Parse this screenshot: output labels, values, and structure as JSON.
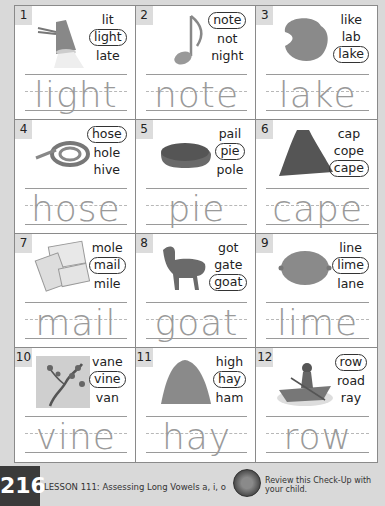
{
  "items": [
    {
      "num": "1",
      "image": "lamp-image",
      "choices": [
        "lit",
        "light",
        "late"
      ],
      "selected": 1,
      "answer": "light"
    },
    {
      "num": "2",
      "image": "music-note-image",
      "choices": [
        "note",
        "not",
        "night"
      ],
      "selected": 0,
      "answer": "note"
    },
    {
      "num": "3",
      "image": "lake-image",
      "choices": [
        "like",
        "lab",
        "lake"
      ],
      "selected": 2,
      "answer": "lake"
    },
    {
      "num": "4",
      "image": "hose-image",
      "choices": [
        "hose",
        "hole",
        "hive"
      ],
      "selected": 0,
      "answer": "hose"
    },
    {
      "num": "5",
      "image": "pie-image",
      "choices": [
        "pail",
        "pie",
        "pole"
      ],
      "selected": 1,
      "answer": "pie"
    },
    {
      "num": "6",
      "image": "cape-image",
      "choices": [
        "cap",
        "cope",
        "cape"
      ],
      "selected": 2,
      "answer": "cape"
    },
    {
      "num": "7",
      "image": "mail-image",
      "choices": [
        "mole",
        "mail",
        "mile"
      ],
      "selected": 1,
      "answer": "mail"
    },
    {
      "num": "8",
      "image": "goat-image",
      "choices": [
        "got",
        "gate",
        "goat"
      ],
      "selected": 2,
      "answer": "goat"
    },
    {
      "num": "9",
      "image": "lime-image",
      "choices": [
        "line",
        "lime",
        "lane"
      ],
      "selected": 1,
      "answer": "lime"
    },
    {
      "num": "10",
      "image": "vine-image",
      "choices": [
        "vane",
        "vine",
        "van"
      ],
      "selected": 1,
      "answer": "vine"
    },
    {
      "num": "11",
      "image": "hay-image",
      "choices": [
        "high",
        "hay",
        "ham"
      ],
      "selected": 1,
      "answer": "hay"
    },
    {
      "num": "12",
      "image": "row-boat-image",
      "choices": [
        "row",
        "road",
        "ray"
      ],
      "selected": 0,
      "answer": "row"
    }
  ],
  "footer": {
    "page_number": "216",
    "lesson": "LESSON 111: Assessing Long Vowels a, i, o",
    "review": "Review this Check-Up with your child."
  }
}
